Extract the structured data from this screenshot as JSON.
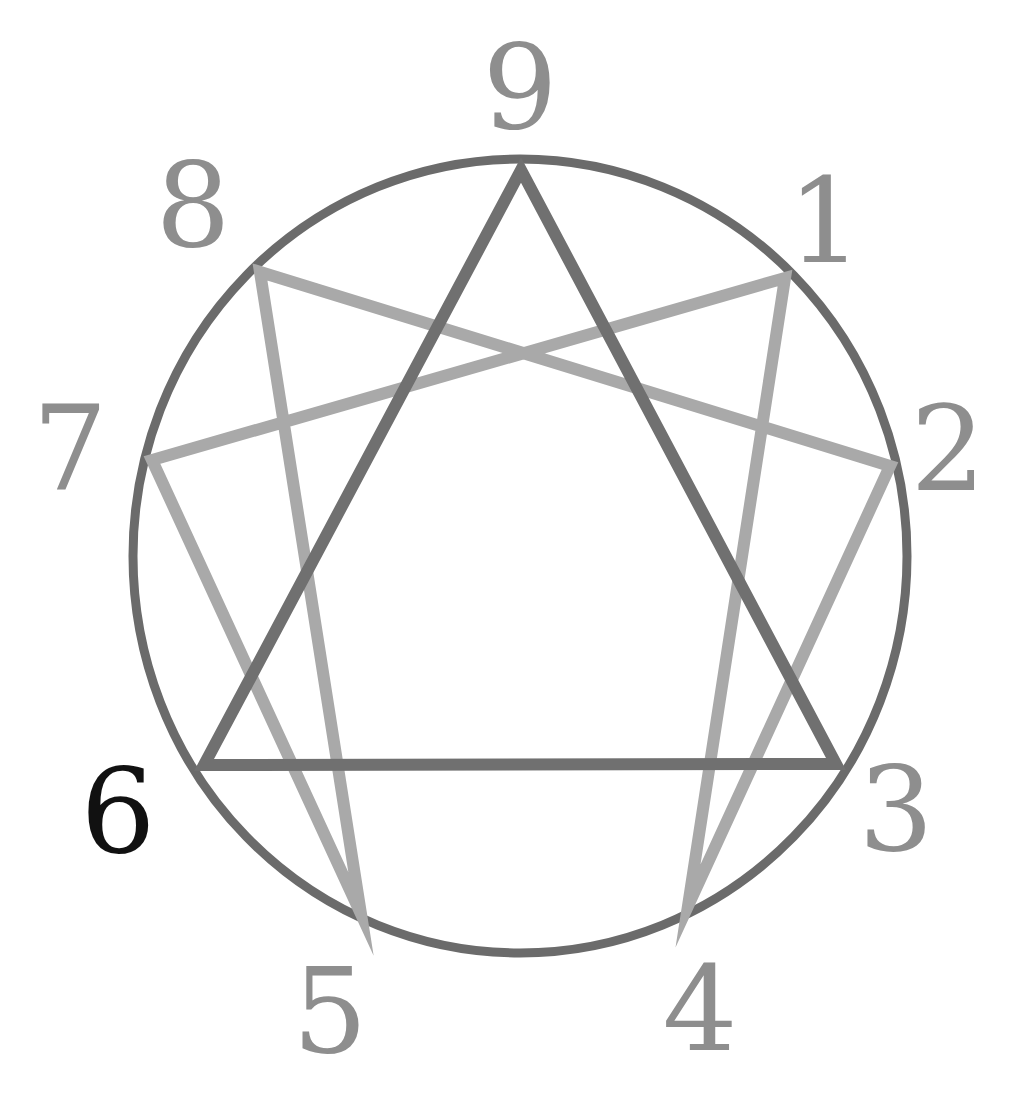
{
  "diagram": {
    "type": "enneagram",
    "colors": {
      "background": "#ffffff",
      "circle": "#6b6b6b",
      "triangle": "#707070",
      "hexad": "#a9a9a9",
      "label": "#8e8e8e",
      "highlight_label": "#111111"
    },
    "circle": {
      "cx": 520,
      "cy": 556,
      "rx": 387,
      "ry": 397,
      "stroke_width": 9
    },
    "points": [
      {
        "id": "9",
        "label": "9",
        "x": 521,
        "y": 170,
        "label_x": 520,
        "label_y": 128,
        "highlight": false
      },
      {
        "id": "1",
        "label": "1",
        "x": 785,
        "y": 278,
        "label_x": 825,
        "label_y": 262,
        "highlight": false
      },
      {
        "id": "2",
        "label": "2",
        "x": 890,
        "y": 466,
        "label_x": 948,
        "label_y": 490,
        "highlight": false
      },
      {
        "id": "3",
        "label": "3",
        "x": 836,
        "y": 764,
        "label_x": 896,
        "label_y": 850,
        "highlight": false
      },
      {
        "id": "4",
        "label": "4",
        "x": 688,
        "y": 906,
        "label_x": 700,
        "label_y": 1050,
        "highlight": false
      },
      {
        "id": "5",
        "label": "5",
        "x": 361,
        "y": 914,
        "label_x": 330,
        "label_y": 1052,
        "highlight": false
      },
      {
        "id": "6",
        "label": "6",
        "x": 204,
        "y": 765,
        "label_x": 118,
        "label_y": 852,
        "highlight": true
      },
      {
        "id": "7",
        "label": "7",
        "x": 152,
        "y": 460,
        "label_x": 70,
        "label_y": 490,
        "highlight": false
      },
      {
        "id": "8",
        "label": "8",
        "x": 260,
        "y": 272,
        "label_x": 193,
        "label_y": 246,
        "highlight": false
      }
    ],
    "triangle": [
      "9",
      "3",
      "6"
    ],
    "hexad": [
      "1",
      "4",
      "2",
      "8",
      "5",
      "7"
    ]
  }
}
